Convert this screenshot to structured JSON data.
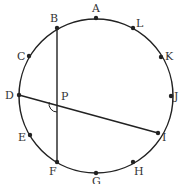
{
  "diagram": {
    "type": "circle-chords",
    "circle": {
      "cx": 96,
      "cy": 96,
      "r": 77
    },
    "points": [
      {
        "name": "A",
        "x": 96,
        "y": 18,
        "lx": 92,
        "ly": 12
      },
      {
        "name": "L",
        "x": 133,
        "y": 28,
        "lx": 136,
        "ly": 27
      },
      {
        "name": "K",
        "x": 161,
        "y": 57,
        "lx": 165,
        "ly": 60
      },
      {
        "name": "J",
        "x": 171,
        "y": 96,
        "lx": 174,
        "ly": 100
      },
      {
        "name": "I",
        "x": 158,
        "y": 133,
        "lx": 162,
        "ly": 141
      },
      {
        "name": "H",
        "x": 133,
        "y": 162,
        "lx": 134,
        "ly": 175
      },
      {
        "name": "G",
        "x": 96,
        "y": 173,
        "lx": 92,
        "ly": 185
      },
      {
        "name": "F",
        "x": 57,
        "y": 162,
        "lx": 49,
        "ly": 175
      },
      {
        "name": "E",
        "x": 30,
        "y": 135,
        "lx": 18,
        "ly": 141
      },
      {
        "name": "D",
        "x": 19,
        "y": 95,
        "lx": 5,
        "ly": 99
      },
      {
        "name": "C",
        "x": 29,
        "y": 56,
        "lx": 17,
        "ly": 60
      },
      {
        "name": "B",
        "x": 57,
        "y": 28,
        "lx": 50,
        "ly": 22
      }
    ],
    "intersection": {
      "name": "P",
      "x": 57,
      "y": 104,
      "lx": 61,
      "ly": 100
    },
    "chords": [
      {
        "from": "B",
        "to": "F"
      },
      {
        "from": "D",
        "to": "I"
      }
    ],
    "angle_mark": {
      "at": "P",
      "between": [
        "D",
        "F"
      ]
    },
    "colors": {
      "stroke": "#222222",
      "label": "#333333",
      "background": "#ffffff"
    }
  }
}
